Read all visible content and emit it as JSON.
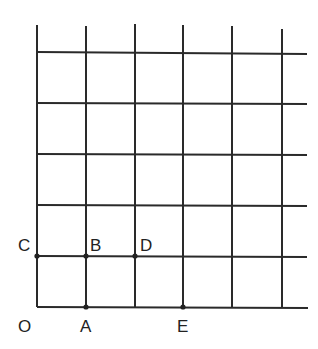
{
  "diagram": {
    "type": "grid",
    "columns_x": [
      37,
      86,
      135,
      183,
      232,
      282
    ],
    "rows_y": [
      52,
      103,
      154,
      205,
      256,
      307
    ],
    "line_color": "#2a2a2a",
    "points": [
      {
        "name": "O",
        "label": "O",
        "col": 0,
        "row": 0,
        "dot": false
      },
      {
        "name": "A",
        "label": "A",
        "col": 1,
        "row": 0,
        "dot": true
      },
      {
        "name": "E",
        "label": "E",
        "col": 3,
        "row": 0,
        "dot": true
      },
      {
        "name": "C",
        "label": "C",
        "col": 0,
        "row": 1,
        "dot": true
      },
      {
        "name": "B",
        "label": "B",
        "col": 1,
        "row": 1,
        "dot": true
      },
      {
        "name": "D",
        "label": "D",
        "col": 2,
        "row": 1,
        "dot": true
      }
    ]
  },
  "labels": {
    "O": "O",
    "A": "A",
    "E": "E",
    "C": "C",
    "B": "B",
    "D": "D"
  }
}
